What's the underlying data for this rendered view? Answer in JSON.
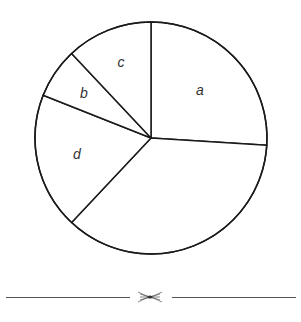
{
  "chart_data": {
    "type": "pie",
    "title": "",
    "start_angle_deg": 0,
    "direction": "clockwise",
    "slices": [
      {
        "label": "a",
        "value": 26,
        "color": "#ffffff"
      },
      {
        "label": "",
        "value": 36,
        "color": "#ffffff"
      },
      {
        "label": "d",
        "value": 19,
        "color": "#ffffff"
      },
      {
        "label": "b",
        "value": 7,
        "color": "#ffffff"
      },
      {
        "label": "c",
        "value": 12,
        "color": "#ffffff"
      }
    ],
    "stroke_color": "#1a1a1a",
    "legend": "none"
  },
  "labels": {
    "a": "a",
    "b": "b",
    "c": "c",
    "d": "d"
  },
  "ornament": {
    "glyph": "divider-ornament"
  }
}
